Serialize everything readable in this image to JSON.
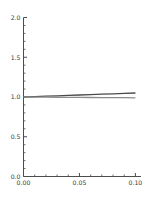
{
  "chart_data": {
    "type": "line",
    "title": "",
    "subtitle": "",
    "xlabel": "",
    "ylabel": "",
    "xlim": [
      0.0,
      0.105
    ],
    "ylim": [
      0.0,
      2.0
    ],
    "grid": false,
    "legend": "none",
    "x_ticks": [
      0.0,
      0.05,
      0.1
    ],
    "x_tick_labels": [
      "0.00",
      "0.05",
      "0.10"
    ],
    "x_minor_ticks": [
      0.01,
      0.02,
      0.03,
      0.04,
      0.06,
      0.07,
      0.08,
      0.09
    ],
    "y_ticks": [
      0.0,
      0.5,
      1.0,
      1.5,
      2.0
    ],
    "y_tick_labels": [
      "0.0",
      "0.5",
      "1.0",
      "1.5",
      "2.0"
    ],
    "y_minor_ticks": [
      0.1,
      0.2,
      0.3,
      0.4,
      0.6,
      0.7,
      0.8,
      0.9,
      1.1,
      1.2,
      1.3,
      1.4,
      1.6,
      1.7,
      1.8,
      1.9
    ],
    "series": [
      {
        "name": "upper",
        "color": "#4a4a4a",
        "x": [
          0.0,
          0.01,
          0.02,
          0.03,
          0.04,
          0.05,
          0.06,
          0.07,
          0.08,
          0.09,
          0.1
        ],
        "values": [
          1.0,
          1.005,
          1.01,
          1.015,
          1.02,
          1.025,
          1.03,
          1.035,
          1.04,
          1.045,
          1.05
        ]
      },
      {
        "name": "lower",
        "color": "#8c8c8c",
        "x": [
          0.0,
          0.01,
          0.02,
          0.03,
          0.04,
          0.05,
          0.06,
          0.07,
          0.08,
          0.09,
          0.1
        ],
        "values": [
          1.0,
          0.999,
          0.998,
          0.997,
          0.996,
          0.995,
          0.994,
          0.993,
          0.992,
          0.991,
          0.99
        ]
      }
    ]
  },
  "axes": {
    "axis_color": "#4d4d4d",
    "background": "#ffffff"
  }
}
